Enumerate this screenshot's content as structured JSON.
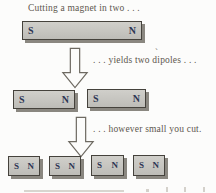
{
  "figure": {
    "title": "Cutting a magnet in two . . .",
    "caption_step1": ". . . yields two dipoles . . .",
    "caption_step2": ". . . however small you cut.",
    "stray_mark": "`"
  },
  "magnets": {
    "row1": [
      {
        "left_pole": "S",
        "right_pole": "N"
      }
    ],
    "row2": [
      {
        "left_pole": "S",
        "right_pole": "N"
      },
      {
        "left_pole": "S",
        "right_pole": "N"
      }
    ],
    "row3": [
      {
        "left_pole": "S",
        "right_pole": "N"
      },
      {
        "left_pole": "S",
        "right_pole": "N"
      },
      {
        "left_pole": "S",
        "right_pole": "N"
      },
      {
        "left_pole": "S",
        "right_pole": "N"
      }
    ]
  },
  "icons": {
    "arrow": "down-block-arrow"
  },
  "colors": {
    "background": "#fcfcfb",
    "magnet_fill": "#c7c6c1",
    "magnet_border": "#45423c",
    "magnet_shadow": "#8a8780",
    "pole_letter": "#2c3554",
    "caption_text": "#5d574e",
    "arrow_outline": "#6e6a62"
  }
}
